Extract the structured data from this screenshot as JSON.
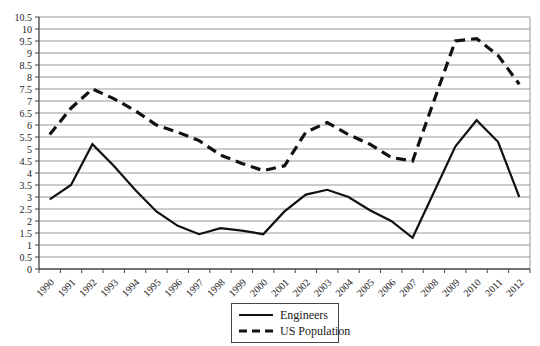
{
  "colors": {
    "line": "#111111",
    "gridline": "#999999",
    "axis": "#444444",
    "text": "#1a1a1a",
    "background": "#ffffff"
  },
  "chart_data": {
    "type": "line",
    "x": [
      "1990",
      "1991",
      "1992",
      "1993",
      "1994",
      "1995",
      "1996",
      "1997",
      "1998",
      "1999",
      "2000",
      "2001",
      "2002",
      "2003",
      "2004",
      "2005",
      "2006",
      "2007",
      "2008",
      "2009",
      "2010",
      "2011",
      "2012"
    ],
    "series": [
      {
        "name": "Engineers",
        "style": "solid",
        "values": [
          2.9,
          3.5,
          5.2,
          4.3,
          3.3,
          2.4,
          1.8,
          1.45,
          1.7,
          1.6,
          1.45,
          2.4,
          3.1,
          3.3,
          3.0,
          2.45,
          2.0,
          1.3,
          3.2,
          5.1,
          6.2,
          5.3,
          3.0
        ]
      },
      {
        "name": "US Population",
        "style": "dashed",
        "values": [
          5.6,
          6.7,
          7.5,
          7.1,
          6.6,
          6.0,
          5.7,
          5.35,
          4.75,
          4.4,
          4.1,
          4.3,
          5.7,
          6.1,
          5.6,
          5.2,
          4.65,
          4.5,
          7.0,
          9.5,
          9.6,
          8.9,
          7.7
        ]
      }
    ],
    "title": "",
    "xlabel": "",
    "ylabel": "",
    "ylim": [
      0,
      10.5
    ],
    "ytick_step": 0.5,
    "grid": true,
    "legend_position": "bottom-center"
  }
}
